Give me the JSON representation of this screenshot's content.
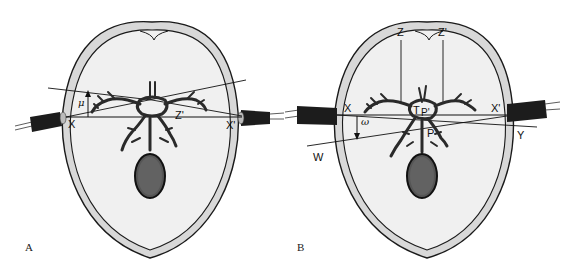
{
  "figure": {
    "colors": {
      "skull_fill": "#d8d8d8",
      "brain_fill": "#f0f0f0",
      "outline": "#1a1a1a",
      "vessel": "#2a2a2a",
      "probe": "#1c1c1c",
      "tumor": "#555555"
    },
    "panels": [
      {
        "id": "A",
        "panel_label": "A",
        "labels": {
          "x": "X",
          "x_prime": "X'",
          "z_prime": "Z'",
          "angle": "μ"
        }
      },
      {
        "id": "B",
        "panel_label": "B",
        "labels": {
          "x": "X",
          "x_prime": "X'",
          "z": "Z",
          "z_prime": "Z'",
          "t": "T",
          "p_prime": "P'",
          "p": "P",
          "w": "W",
          "y": "Y",
          "angle": "ω"
        }
      }
    ]
  }
}
